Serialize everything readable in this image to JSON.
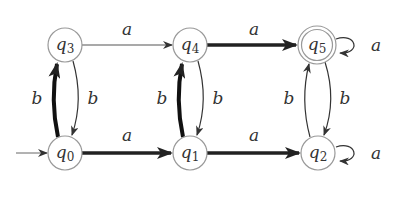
{
  "diagram": {
    "type": "finite-automaton",
    "colors": {
      "stroke": "#333333",
      "node_stroke": "#888888",
      "background": "#ffffff"
    },
    "initial_state": "q0",
    "accepting_states": [
      "q5"
    ],
    "nodes": [
      {
        "id": "q0",
        "name": "q",
        "sub": "0",
        "x": 65,
        "y": 153
      },
      {
        "id": "q1",
        "name": "q",
        "sub": "1",
        "x": 190,
        "y": 153
      },
      {
        "id": "q2",
        "name": "q",
        "sub": "2",
        "x": 318,
        "y": 153
      },
      {
        "id": "q3",
        "name": "q",
        "sub": "3",
        "x": 65,
        "y": 45
      },
      {
        "id": "q4",
        "name": "q",
        "sub": "4",
        "x": 190,
        "y": 45
      },
      {
        "id": "q5",
        "name": "q",
        "sub": "5",
        "x": 317,
        "y": 45
      }
    ],
    "edges": [
      {
        "from": "q3",
        "to": "q4",
        "label": "a",
        "bold": false
      },
      {
        "from": "q4",
        "to": "q5",
        "label": "a",
        "bold": true
      },
      {
        "from": "q5",
        "to": "q5",
        "label": "a",
        "bold": false
      },
      {
        "from": "q0",
        "to": "q1",
        "label": "a",
        "bold": true
      },
      {
        "from": "q1",
        "to": "q2",
        "label": "a",
        "bold": true
      },
      {
        "from": "q2",
        "to": "q2",
        "label": "a",
        "bold": false
      },
      {
        "from": "q0",
        "to": "q3",
        "label": "b",
        "bold": true
      },
      {
        "from": "q3",
        "to": "q0",
        "label": "b",
        "bold": false
      },
      {
        "from": "q1",
        "to": "q4",
        "label": "b",
        "bold": true
      },
      {
        "from": "q4",
        "to": "q1",
        "label": "b",
        "bold": false
      },
      {
        "from": "q2",
        "to": "q5",
        "label": "b",
        "bold": false
      },
      {
        "from": "q5",
        "to": "q2",
        "label": "b",
        "bold": false
      }
    ],
    "labels": {
      "a": "a",
      "b": "b"
    }
  }
}
